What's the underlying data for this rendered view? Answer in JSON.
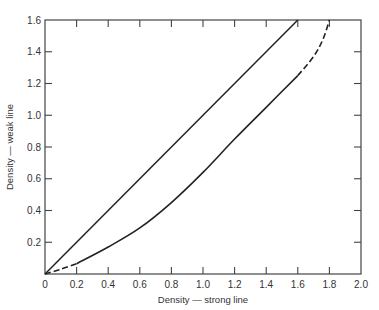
{
  "chart_data": {
    "type": "line",
    "title": "",
    "xlabel": "Density — strong line",
    "ylabel": "Density — weak line",
    "xlim": [
      0,
      2.0
    ],
    "ylim": [
      0,
      1.6
    ],
    "x_ticks": [
      "0",
      "0.2",
      "0.4",
      "0.6",
      "0.8",
      "1.0",
      "1.2",
      "1.4",
      "1.6",
      "1.8",
      "2.0"
    ],
    "y_ticks": [
      "0.2",
      "0.4",
      "0.6",
      "0.8",
      "1.0",
      "1.2",
      "1.4",
      "1.6"
    ],
    "grid": false,
    "legend": null,
    "series": [
      {
        "name": "straight line (equal ratio)",
        "style": "solid",
        "x": [
          0,
          1.6
        ],
        "y": [
          0,
          1.6
        ]
      },
      {
        "name": "measured curve",
        "style": "solid with dashed extrapolated ends",
        "dashed_start": {
          "x": [
            0,
            0.1,
            0.2
          ],
          "y": [
            0,
            0.03,
            0.065
          ]
        },
        "x": [
          0.2,
          0.4,
          0.6,
          0.8,
          1.0,
          1.2,
          1.4,
          1.6
        ],
        "y": [
          0.065,
          0.17,
          0.29,
          0.45,
          0.64,
          0.85,
          1.05,
          1.25
        ],
        "dashed_end": {
          "x": [
            1.6,
            1.7,
            1.76,
            1.8
          ],
          "y": [
            1.25,
            1.37,
            1.48,
            1.6
          ]
        }
      }
    ]
  }
}
